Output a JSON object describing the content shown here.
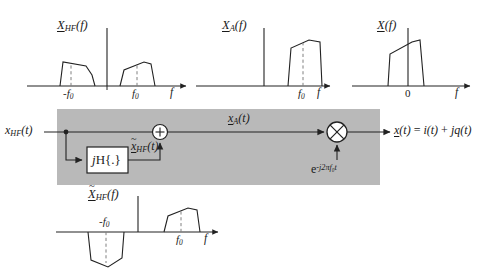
{
  "figure": {
    "kind": "signal-flow-block-diagram",
    "block_fill": "#b9b9b9",
    "line_color": "#222222",
    "dashed_color": "#777777"
  },
  "axis": {
    "freq_symbol": "f",
    "time_symbol": "t"
  },
  "plots": [
    {
      "id": "x-hf-spectrum",
      "title": {
        "main": "X",
        "sub": "HF",
        "arg": "(f)",
        "tilde": false
      },
      "xlabel": "f",
      "ticks": [
        "-f₀",
        "f₀"
      ],
      "tick_labels": {
        "neg": "-f",
        "neg_sub": "0",
        "pos": "f",
        "pos_sub": "0"
      },
      "lobes": "two real trapezoids, positive, at -f0 and +f0"
    },
    {
      "id": "x-a-spectrum",
      "title": {
        "main": "X",
        "sub": "A",
        "arg": "(f)",
        "tilde": false
      },
      "xlabel": "f",
      "ticks": [
        "f₀"
      ],
      "tick_labels": {
        "pos": "f",
        "pos_sub": "0"
      },
      "lobes": "single positive trapezoid at +f0, negative band suppressed"
    },
    {
      "id": "x-baseband-spectrum",
      "title": {
        "main": "X",
        "sub": "",
        "arg": "(f)",
        "tilde": false
      },
      "xlabel": "f",
      "ticks": [
        "0"
      ],
      "tick_labels": {
        "origin": "0"
      },
      "lobes": "single positive trapezoid centred about 0"
    },
    {
      "id": "x-hf-hilbert-spectrum",
      "title": {
        "main": "X",
        "sub": "HF",
        "arg": "(f)",
        "tilde": true
      },
      "xlabel": "f",
      "ticks": [
        "-f₀",
        "f₀"
      ],
      "tick_labels": {
        "neg": "-f",
        "neg_sub": "0",
        "pos": "f",
        "pos_sub": "0"
      },
      "lobes": "odd symmetry: negative trapezoid at -f0, positive trapezoid at +f0"
    }
  ],
  "signals": {
    "input": {
      "main": "x",
      "sub": "HF",
      "arg": "(t)"
    },
    "hilbert_output": {
      "main": "x",
      "sub": "HF",
      "arg": "(t)",
      "tilde": true
    },
    "analytic": {
      "main": "x",
      "sub": "A",
      "arg": "(t)"
    },
    "lo": {
      "base": "e",
      "exponent": "-j2πf₀t"
    },
    "output": {
      "text": "x(t) = i(t) + jq(t)",
      "lhs": "x",
      "lhs_arg": "(t)",
      "eq": " = ",
      "i": "i",
      "i_arg": "(t)",
      "plus": " + ",
      "j": "j",
      "q": "q",
      "q_arg": "(t)"
    }
  },
  "blocks": [
    {
      "id": "hilbert-block",
      "label_j": "j",
      "label_H": "H{.}",
      "label_full": "jH{.}"
    },
    {
      "id": "summing-junction",
      "symbol": "+"
    },
    {
      "id": "mixer",
      "symbol": "×"
    }
  ]
}
